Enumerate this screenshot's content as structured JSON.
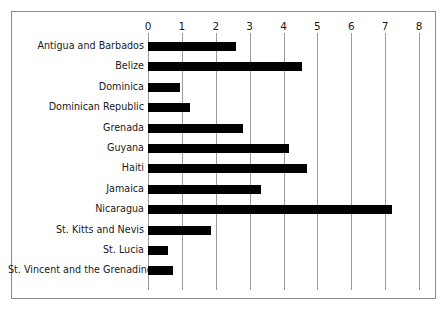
{
  "chart_data": {
    "type": "bar",
    "orientation": "horizontal",
    "title": "",
    "subtitle": "",
    "xlabel": "",
    "ylabel": "",
    "xlim": [
      0,
      8
    ],
    "ylim": null,
    "grid": true,
    "grid_axis": "x",
    "legend": false,
    "legend_position": "none",
    "xticks": [
      0,
      1,
      2,
      3,
      4,
      5,
      6,
      7,
      8
    ],
    "xtick_labels": [
      "0",
      "1",
      "2",
      "3",
      "4",
      "5",
      "6",
      "7",
      "8"
    ],
    "categories": [
      "Antigua and Barbados",
      "Belize",
      "Dominica",
      "Dominican Republic",
      "Grenada",
      "Guyana",
      "Haiti",
      "Jamaica",
      "Nicaragua",
      "St. Kitts and Nevis",
      "St. Lucia",
      "St. Vincent and the Grenadines"
    ],
    "values": [
      2.6,
      4.55,
      0.95,
      1.25,
      2.8,
      4.15,
      4.7,
      3.35,
      7.2,
      1.85,
      0.6,
      0.75
    ],
    "series": [
      {
        "name": "",
        "values": [
          2.6,
          4.55,
          0.95,
          1.25,
          2.8,
          4.15,
          4.7,
          3.35,
          7.2,
          1.85,
          0.6,
          0.75
        ]
      }
    ],
    "bar_color": "#000000",
    "grid_color": "#9a9a9a",
    "frame_color": "#8a8a8a",
    "background_color": "#ffffff",
    "annotations": []
  }
}
